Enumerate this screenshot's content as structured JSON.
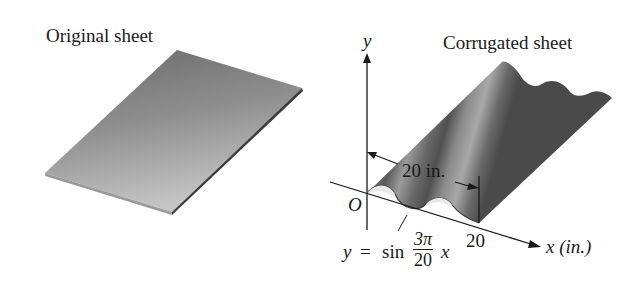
{
  "left_panel": {
    "title": "Original sheet"
  },
  "right_panel": {
    "title": "Corrugated sheet",
    "y_axis_label": "y",
    "x_axis_label": "x (in.)",
    "origin_label": "O",
    "x_tick_label": "20",
    "dimension_label": "20 in.",
    "equation": {
      "lhs": "y",
      "eq": "=",
      "func": "sin",
      "numerator": "3π",
      "denominator": "20",
      "var": "x"
    }
  },
  "colors": {
    "sheet_dark": "#5a5a5a",
    "sheet_light": "#b5b5b5",
    "line": "#1a1a1a"
  }
}
